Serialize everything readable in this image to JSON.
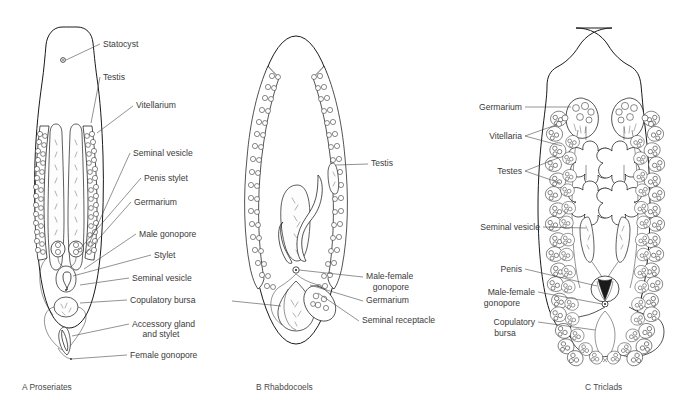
{
  "figure": {
    "background": "#ffffff",
    "ink": "#1a1a1a",
    "label_color": "#3a3a3a"
  },
  "panels": [
    {
      "id": "A",
      "caption": "A  Proseriates",
      "caption_letter": "A",
      "caption_name": "Proseriates",
      "labels": [
        {
          "key": "statocyst",
          "text": "Statocyst",
          "x": 103,
          "y": 47,
          "align": "start"
        },
        {
          "key": "testis",
          "text": "Testis",
          "x": 103,
          "y": 80,
          "align": "start"
        },
        {
          "key": "vitellarium",
          "text": "Vitellarium",
          "x": 136,
          "y": 108,
          "align": "start"
        },
        {
          "key": "seminal_vesicle_1",
          "text": "Seminal vesicle",
          "x": 133,
          "y": 156,
          "align": "start"
        },
        {
          "key": "penis_stylet",
          "text": "Penis stylet",
          "x": 144,
          "y": 181,
          "align": "start"
        },
        {
          "key": "germarium",
          "text": "Germarium",
          "x": 134,
          "y": 205,
          "align": "start"
        },
        {
          "key": "male_gonopore",
          "text": "Male gonopore",
          "x": 139,
          "y": 237,
          "align": "start"
        },
        {
          "key": "stylet",
          "text": "Stylet",
          "x": 154,
          "y": 258,
          "align": "start"
        },
        {
          "key": "seminal_vesicle_2",
          "text": "Seminal vesicle",
          "x": 132,
          "y": 281,
          "align": "start"
        },
        {
          "key": "copulatory_bursa",
          "text": "Copulatory bursa",
          "x": 130,
          "y": 303,
          "align": "start"
        },
        {
          "key": "accessory_gland",
          "text": "Accessory gland",
          "x": 132,
          "y": 327,
          "align": "start"
        },
        {
          "key": "accessory_gland2",
          "text": "and stylet",
          "x": 161,
          "y": 337,
          "align": "middle"
        },
        {
          "key": "female_gonopore",
          "text": "Female gonopore",
          "x": 130,
          "y": 358,
          "align": "start"
        }
      ]
    },
    {
      "id": "B",
      "caption": "B  Rhabdocoels",
      "caption_letter": "B",
      "caption_name": "Rhabdocoels",
      "labels": [
        {
          "key": "testis",
          "text": "Testis",
          "x": 371,
          "y": 166,
          "align": "start"
        },
        {
          "key": "male_female_gono",
          "text": "Male-female",
          "x": 366,
          "y": 279,
          "align": "start"
        },
        {
          "key": "male_female_gono2",
          "text": "gonopore",
          "x": 391,
          "y": 290,
          "align": "middle"
        },
        {
          "key": "germarium",
          "text": "Germarium",
          "x": 366,
          "y": 303,
          "align": "start"
        },
        {
          "key": "seminal_receptacle",
          "text": "Seminal receptacle",
          "x": 362,
          "y": 323,
          "align": "start"
        }
      ]
    },
    {
      "id": "C",
      "caption": "C  Triclads",
      "caption_letter": "C",
      "caption_name": "Triclads",
      "labels": [
        {
          "key": "germarium",
          "text": "Germarium",
          "x": 522,
          "y": 110,
          "align": "end"
        },
        {
          "key": "vitellaria",
          "text": "Vitellaria",
          "x": 522,
          "y": 139,
          "align": "end"
        },
        {
          "key": "testes",
          "text": "Testes",
          "x": 522,
          "y": 174,
          "align": "end"
        },
        {
          "key": "seminal_vesicle",
          "text": "Seminal vesicle",
          "x": 540,
          "y": 230,
          "align": "end"
        },
        {
          "key": "penis",
          "text": "Penis",
          "x": 522,
          "y": 272,
          "align": "end"
        },
        {
          "key": "male_female_gono",
          "text": "Male-female",
          "x": 535,
          "y": 295,
          "align": "end"
        },
        {
          "key": "male_female_gono2",
          "text": "gonopore",
          "x": 502,
          "y": 306,
          "align": "middle"
        },
        {
          "key": "copulatory_bursa",
          "text": "Copulatory",
          "x": 535,
          "y": 325,
          "align": "end"
        },
        {
          "key": "copulatory_bursa2",
          "text": "bursa",
          "x": 505,
          "y": 336,
          "align": "middle"
        }
      ]
    }
  ],
  "captions": [
    {
      "key": "a",
      "text": "A  Proseriates",
      "x": 22,
      "y": 390
    },
    {
      "key": "b",
      "text": "B  Rhabdocoels",
      "x": 256,
      "y": 390
    },
    {
      "key": "c",
      "text": "C  Triclads",
      "x": 585,
      "y": 390
    }
  ]
}
